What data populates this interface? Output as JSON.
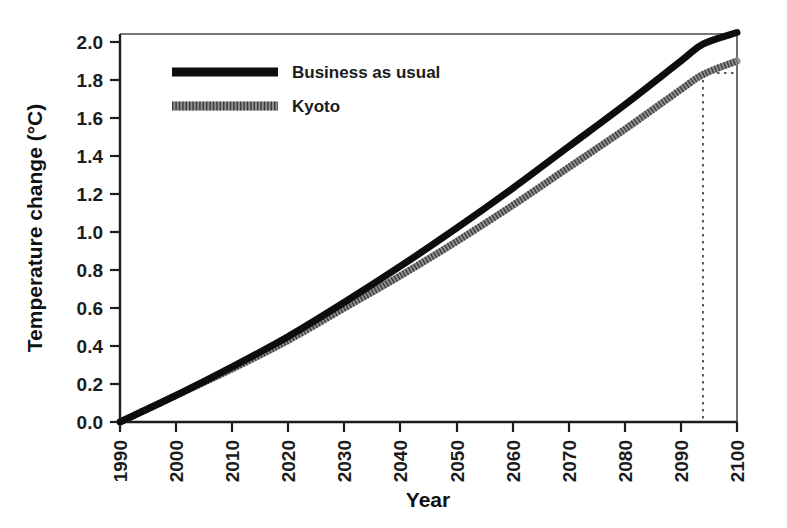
{
  "chart_data": {
    "type": "line",
    "title": "",
    "xlabel": "Year",
    "ylabel": "Temperature change (°C)",
    "xlim": [
      1990,
      2100
    ],
    "ylim": [
      0.0,
      2.0
    ],
    "grid": false,
    "legend_position": "top-left inside plot",
    "x_tick_labels": [
      "1990",
      "2000",
      "2010",
      "2020",
      "2030",
      "2040",
      "2050",
      "2060",
      "2070",
      "2080",
      "2090",
      "2100"
    ],
    "x_ticks": [
      1990,
      2000,
      2010,
      2020,
      2030,
      2040,
      2050,
      2060,
      2070,
      2080,
      2090,
      2100
    ],
    "y_tick_labels": [
      "0.0",
      "0.2",
      "0.4",
      "0.6",
      "0.8",
      "1.0",
      "1.2",
      "1.4",
      "1.6",
      "1.8",
      "2.0"
    ],
    "y_ticks": [
      0.0,
      0.2,
      0.4,
      0.6,
      0.8,
      1.0,
      1.2,
      1.4,
      1.6,
      1.8,
      2.0
    ],
    "x": [
      1990,
      2000,
      2010,
      2020,
      2030,
      2040,
      2050,
      2060,
      2070,
      2080,
      2090,
      2094,
      2100
    ],
    "series": [
      {
        "name": "Business as usual",
        "style": "solid-thick-black",
        "color": "#0d0d0d",
        "values": [
          0.0,
          0.14,
          0.29,
          0.45,
          0.63,
          0.82,
          1.02,
          1.23,
          1.45,
          1.67,
          1.9,
          1.99,
          2.05
        ]
      },
      {
        "name": "Kyoto",
        "style": "hatched-thick-grey",
        "color": "#8f8f8f",
        "values": [
          0.0,
          0.14,
          0.28,
          0.43,
          0.6,
          0.77,
          0.95,
          1.14,
          1.34,
          1.54,
          1.75,
          1.83,
          1.9
        ]
      }
    ],
    "annotations": [
      {
        "name": "kyoto-delay-guide",
        "type": "dotted-reference-lines",
        "vertical_line_x": 2094,
        "horizontal_line_y": 1.9,
        "description": "Dotted lines marking the year at which Business as usual reaches the Kyoto 2100 temperature"
      }
    ]
  },
  "legend": {
    "items": [
      {
        "label": "Business as usual"
      },
      {
        "label": "Kyoto"
      }
    ]
  },
  "axes": {
    "x_title": "Year",
    "y_title": "Temperature change (°C)"
  },
  "colors": {
    "bau": "#0d0d0d",
    "kyoto": "#8f8f8f",
    "axis": "#1c1c1c",
    "guide": "#5a5a5a",
    "background": "#ffffff"
  }
}
